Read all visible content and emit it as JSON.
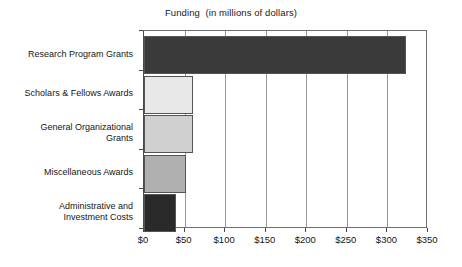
{
  "chart_data": {
    "type": "bar",
    "orientation": "horizontal",
    "title": "Funding  (in millions of dollars)",
    "xlabel": "",
    "ylabel": "",
    "categories": [
      "Research Program Grants",
      "Scholars & Fellows Awards",
      "General Organizational\nGrants",
      "Miscellaneous Awards",
      "Administrative and\nInvestment Costs"
    ],
    "values": [
      323,
      61,
      60,
      52,
      40
    ],
    "bar_colors": [
      "#3a3a3a",
      "#e8e8e8",
      "#d0d0d0",
      "#b0b0b0",
      "#2a2a2a"
    ],
    "bar_border_color": "#555555",
    "xlim": [
      0,
      350
    ],
    "xticks": [
      0,
      50,
      100,
      150,
      200,
      250,
      300,
      350
    ],
    "xtick_labels": [
      "$0",
      "$50",
      "$100",
      "$150",
      "$200",
      "$250",
      "$300",
      "$350"
    ],
    "grid": "vertical",
    "gridline_color": "#9a9a9a",
    "legend": null,
    "legend_position": "none",
    "units": "millions of dollars"
  }
}
